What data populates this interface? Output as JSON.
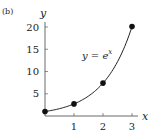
{
  "panel_label": "(b)",
  "chart_data": {
    "type": "line",
    "title": "",
    "xlabel": "x",
    "ylabel": "y",
    "annotation": "y = e^x",
    "annotation_parts": {
      "lhs": "y = e",
      "sup": "x"
    },
    "x_ticks": [
      "1",
      "2",
      "3"
    ],
    "y_ticks": [
      "5",
      "10",
      "15",
      "20"
    ],
    "xlim": [
      0,
      3.2
    ],
    "ylim": [
      0,
      21.5
    ],
    "grid": false,
    "legend": null,
    "series": [
      {
        "name": "y = e^x",
        "curve": "exp",
        "points": [
          {
            "x": 0,
            "y": 1
          },
          {
            "x": 1,
            "y": 2.718
          },
          {
            "x": 2,
            "y": 7.389
          },
          {
            "x": 3,
            "y": 20.086
          }
        ]
      }
    ]
  },
  "colors": {
    "ink": "#222222",
    "background": "#ffffff"
  }
}
